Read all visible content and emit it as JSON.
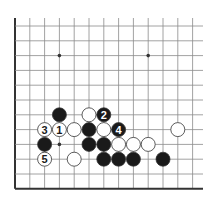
{
  "diagram": {
    "type": "go-board-fragment",
    "grid": {
      "columns": 13,
      "rows": 12,
      "edges": [
        "left",
        "bottom"
      ],
      "open_edges": [
        "top",
        "right"
      ]
    },
    "star_points": [
      {
        "col": 3,
        "row": 2
      },
      {
        "col": 9,
        "row": 2
      },
      {
        "col": 3,
        "row": 8
      }
    ],
    "stones": [
      {
        "color": "black",
        "col": 3,
        "row": 6,
        "label": ""
      },
      {
        "color": "white",
        "col": 5,
        "row": 6,
        "label": ""
      },
      {
        "color": "black",
        "col": 6,
        "row": 6,
        "label": "2"
      },
      {
        "color": "white",
        "col": 2,
        "row": 7,
        "label": "3"
      },
      {
        "color": "white",
        "col": 3,
        "row": 7,
        "label": "1"
      },
      {
        "color": "white",
        "col": 4,
        "row": 7,
        "label": ""
      },
      {
        "color": "black",
        "col": 5,
        "row": 7,
        "label": ""
      },
      {
        "color": "white",
        "col": 6,
        "row": 7,
        "label": ""
      },
      {
        "color": "black",
        "col": 7,
        "row": 7,
        "label": "4"
      },
      {
        "color": "white",
        "col": 11,
        "row": 7,
        "label": ""
      },
      {
        "color": "black",
        "col": 2,
        "row": 8,
        "label": ""
      },
      {
        "color": "black",
        "col": 5,
        "row": 8,
        "label": ""
      },
      {
        "color": "black",
        "col": 6,
        "row": 8,
        "label": ""
      },
      {
        "color": "white",
        "col": 7,
        "row": 8,
        "label": ""
      },
      {
        "color": "white",
        "col": 8,
        "row": 8,
        "label": ""
      },
      {
        "color": "white",
        "col": 9,
        "row": 8,
        "label": ""
      },
      {
        "color": "white",
        "col": 2,
        "row": 9,
        "label": "5"
      },
      {
        "color": "white",
        "col": 4,
        "row": 9,
        "label": ""
      },
      {
        "color": "black",
        "col": 6,
        "row": 9,
        "label": ""
      },
      {
        "color": "black",
        "col": 7,
        "row": 9,
        "label": ""
      },
      {
        "color": "black",
        "col": 8,
        "row": 9,
        "label": ""
      },
      {
        "color": "black",
        "col": 10,
        "row": 9,
        "label": ""
      }
    ],
    "colors": {
      "background": "#ffffff",
      "grid_line": "#8a8a8a",
      "edge_line": "#333333",
      "black_stone": "#1a1a1a",
      "white_stone": "#ffffff",
      "stone_outline": "#333333",
      "label_on_black": "#ffffff",
      "label_on_white": "#1a1a1a"
    }
  }
}
